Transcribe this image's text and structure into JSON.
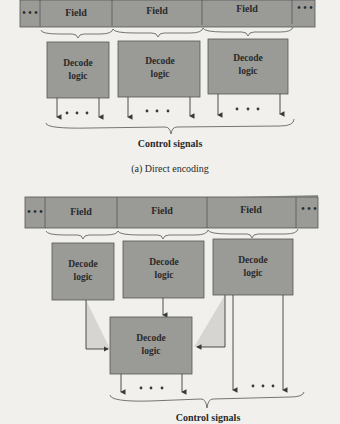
{
  "diagram_a": {
    "fields": [
      "Field",
      "Field",
      "Field"
    ],
    "ellipsis": "• • •",
    "decoders": [
      {
        "line1": "Decode",
        "line2": "logic"
      },
      {
        "line1": "Decode",
        "line2": "logic"
      },
      {
        "line1": "Decode",
        "line2": "logic"
      }
    ],
    "output_label": "Control signals",
    "caption": "(a) Direct encoding"
  },
  "diagram_b": {
    "fields": [
      "Field",
      "Field",
      "Field"
    ],
    "ellipsis": "• • •",
    "decoders": [
      {
        "line1": "Decode",
        "line2": "logic"
      },
      {
        "line1": "Decode",
        "line2": "logic"
      },
      {
        "line1": "Decode",
        "line2": "logic"
      }
    ],
    "second_stage_decoder": {
      "line1": "Decode",
      "line2": "logic"
    },
    "output_label": "Control signals"
  },
  "colors": {
    "box_fill": "#9a9a96",
    "background": "#f1f0ec",
    "line": "#3a3a3a",
    "shade": "#d6d5d1"
  }
}
